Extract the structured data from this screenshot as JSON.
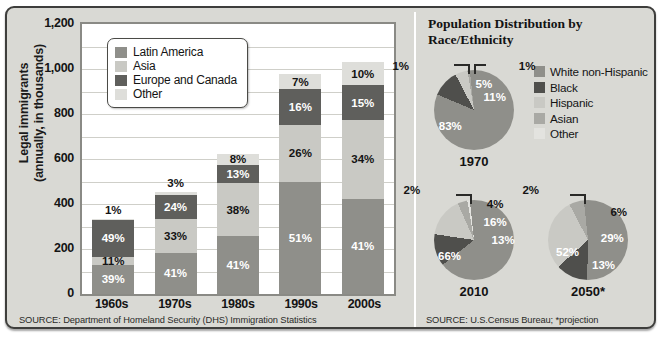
{
  "palette": {
    "latin_america": "#8f8f8a",
    "asia": "#c9c9c4",
    "europe_canada": "#5f5f5c",
    "other": "#dedeDA",
    "white_non_hispanic": "#8f8f8a",
    "black": "#4f4f4c",
    "hispanic": "#c9c9c4",
    "asian": "#a9a9a4",
    "other_pie": "#e3e3df",
    "card_bg": "#d9d9d4",
    "plot_bg": "#ffffff",
    "frame": "#3e3e3c"
  },
  "left_panel": {
    "y_axis_label": "Legal immigrants\n(annually, in thousands)",
    "y_axis_label_line1": "Legal immigrants",
    "y_axis_label_line2": "(annually, in thousands)",
    "y_ticks": [
      "1,200",
      "1,000",
      "800",
      "600",
      "400",
      "200",
      "0"
    ],
    "legend": [
      {
        "label": "Latin America",
        "color_key": "latin_america"
      },
      {
        "label": "Asia",
        "color_key": "asia"
      },
      {
        "label": "Europe and Canada",
        "color_key": "europe_canada"
      },
      {
        "label": "Other",
        "color_key": "other"
      }
    ],
    "source": "SOURCE: Department of Homeland Security (DHS) Immigration Statistics"
  },
  "right_panel": {
    "title_line1": "Population Distribution by",
    "title_line2": "Race/Ethnicity",
    "title": "Population Distribution by Race/Ethnicity",
    "legend": [
      {
        "label": "White non-Hispanic",
        "color_key": "white_non_hispanic"
      },
      {
        "label": "Black",
        "color_key": "black"
      },
      {
        "label": "Hispanic",
        "color_key": "hispanic"
      },
      {
        "label": "Asian",
        "color_key": "asian"
      },
      {
        "label": "Other",
        "color_key": "other_pie"
      }
    ],
    "source": "SOURCE: U.S.Census Bureau; *projection"
  },
  "chart_data": [
    {
      "type": "bar",
      "subtype": "stacked-column",
      "title": "",
      "xlabel": "",
      "ylabel": "Legal immigrants (annually, in thousands)",
      "ylim": [
        0,
        1200
      ],
      "ytick_values": [
        0,
        200,
        400,
        600,
        800,
        1000,
        1200
      ],
      "ytick_labels": [
        "0",
        "200",
        "400",
        "600",
        "800",
        "1,000",
        "1,200"
      ],
      "grid": true,
      "grid_minor_step": 100,
      "legend_position": "inside-top-left",
      "categories": [
        "1960s",
        "1970s",
        "1980s",
        "1990s",
        "2000s"
      ],
      "totals_thousands": [
        332,
        449,
        624,
        978,
        1031
      ],
      "series": [
        {
          "name": "Latin America",
          "color_key": "latin_america",
          "values": [
            39,
            41,
            41,
            51,
            41
          ],
          "unit": "percent"
        },
        {
          "name": "Asia",
          "color_key": "asia",
          "values": [
            11,
            33,
            38,
            26,
            34
          ],
          "unit": "percent"
        },
        {
          "name": "Europe and Canada",
          "color_key": "europe_canada",
          "values": [
            49,
            24,
            13,
            16,
            15
          ],
          "unit": "percent"
        },
        {
          "name": "Other",
          "color_key": "other",
          "values": [
            1,
            3,
            8,
            7,
            10
          ],
          "unit": "percent"
        }
      ],
      "bars": [
        {
          "category": "1960s",
          "total": 332,
          "segments": [
            {
              "name": "Latin America",
              "pct": 39,
              "label": "39%",
              "color_key": "latin_america",
              "text_color": "#ffffff",
              "label_inside": true
            },
            {
              "name": "Asia",
              "pct": 11,
              "label": "11%",
              "color_key": "asia",
              "text_color": "#141414",
              "label_inside": true
            },
            {
              "name": "Europe and Canada",
              "pct": 49,
              "label": "49%",
              "color_key": "europe_canada",
              "text_color": "#ffffff",
              "label_inside": true
            },
            {
              "name": "Other",
              "pct": 1,
              "label": "1%",
              "color_key": "other",
              "text_color": "#141414",
              "label_inside": false
            }
          ]
        },
        {
          "category": "1970s",
          "total": 449,
          "segments": [
            {
              "name": "Latin America",
              "pct": 41,
              "label": "41%",
              "color_key": "latin_america",
              "text_color": "#ffffff",
              "label_inside": true
            },
            {
              "name": "Asia",
              "pct": 33,
              "label": "33%",
              "color_key": "asia",
              "text_color": "#141414",
              "label_inside": true
            },
            {
              "name": "Europe and Canada",
              "pct": 24,
              "label": "24%",
              "color_key": "europe_canada",
              "text_color": "#ffffff",
              "label_inside": true
            },
            {
              "name": "Other",
              "pct": 3,
              "label": "3%",
              "color_key": "other",
              "text_color": "#141414",
              "label_inside": false
            }
          ]
        },
        {
          "category": "1980s",
          "total": 624,
          "segments": [
            {
              "name": "Latin America",
              "pct": 41,
              "label": "41%",
              "color_key": "latin_america",
              "text_color": "#ffffff",
              "label_inside": true
            },
            {
              "name": "Asia",
              "pct": 38,
              "label": "38%",
              "color_key": "asia",
              "text_color": "#141414",
              "label_inside": true
            },
            {
              "name": "Europe and Canada",
              "pct": 13,
              "label": "13%",
              "color_key": "europe_canada",
              "text_color": "#ffffff",
              "label_inside": true
            },
            {
              "name": "Other",
              "pct": 8,
              "label": "8%",
              "color_key": "other",
              "text_color": "#141414",
              "label_inside": true
            }
          ]
        },
        {
          "category": "1990s",
          "total": 978,
          "segments": [
            {
              "name": "Latin America",
              "pct": 51,
              "label": "51%",
              "color_key": "latin_america",
              "text_color": "#ffffff",
              "label_inside": true
            },
            {
              "name": "Asia",
              "pct": 26,
              "label": "26%",
              "color_key": "asia",
              "text_color": "#141414",
              "label_inside": true
            },
            {
              "name": "Europe and Canada",
              "pct": 16,
              "label": "16%",
              "color_key": "europe_canada",
              "text_color": "#ffffff",
              "label_inside": true
            },
            {
              "name": "Other",
              "pct": 7,
              "label": "7%",
              "color_key": "other",
              "text_color": "#141414",
              "label_inside": true
            }
          ]
        },
        {
          "category": "2000s",
          "total": 1031,
          "segments": [
            {
              "name": "Latin America",
              "pct": 41,
              "label": "41%",
              "color_key": "latin_america",
              "text_color": "#ffffff",
              "label_inside": true
            },
            {
              "name": "Asia",
              "pct": 34,
              "label": "34%",
              "color_key": "asia",
              "text_color": "#141414",
              "label_inside": true
            },
            {
              "name": "Europe and Canada",
              "pct": 15,
              "label": "15%",
              "color_key": "europe_canada",
              "text_color": "#ffffff",
              "label_inside": true
            },
            {
              "name": "Other",
              "pct": 10,
              "label": "10%",
              "color_key": "other",
              "text_color": "#141414",
              "label_inside": true
            }
          ]
        }
      ]
    },
    {
      "type": "pie",
      "title": "1970",
      "year": "1970",
      "labels": [
        "White non-Hispanic",
        "Black",
        "Hispanic",
        "Asian",
        "Other"
      ],
      "values": [
        83,
        11,
        5,
        1,
        1
      ],
      "value_labels": [
        "83%",
        "11%",
        "5%",
        "1%",
        "1%"
      ],
      "color_keys": [
        "white_non_hispanic",
        "black",
        "hispanic",
        "asian",
        "other_pie"
      ]
    },
    {
      "type": "pie",
      "title": "2010",
      "year": "2010",
      "labels": [
        "White non-Hispanic",
        "Black",
        "Hispanic",
        "Asian",
        "Other"
      ],
      "values": [
        66,
        13,
        16,
        4,
        2
      ],
      "value_labels": [
        "66%",
        "13%",
        "16%",
        "4%",
        "2%"
      ],
      "color_keys": [
        "white_non_hispanic",
        "black",
        "hispanic",
        "asian",
        "other_pie"
      ]
    },
    {
      "type": "pie",
      "title": "2050*",
      "year": "2050*",
      "labels": [
        "White non-Hispanic",
        "Black",
        "Hispanic",
        "Asian",
        "Other"
      ],
      "values": [
        52,
        13,
        29,
        6,
        2
      ],
      "value_labels": [
        "52%",
        "13%",
        "29%",
        "6%",
        "2%"
      ],
      "color_keys": [
        "white_non_hispanic",
        "black",
        "hispanic",
        "asian",
        "other_pie"
      ]
    }
  ]
}
